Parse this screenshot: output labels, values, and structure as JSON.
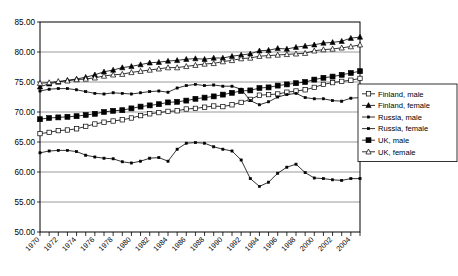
{
  "chart_data": {
    "type": "line",
    "title": "",
    "subtitle": "",
    "xlabel": "",
    "ylabel": "",
    "xlim": [
      1970,
      2005
    ],
    "ylim": [
      50.0,
      85.0
    ],
    "yticks": [
      "50.00",
      "55.00",
      "60.00",
      "65.00",
      "70.00",
      "75.00",
      "80.00",
      "85.00"
    ],
    "ytick_values": [
      50,
      55,
      60,
      65,
      70,
      75,
      80,
      85
    ],
    "xticks": [
      "1970",
      "1972",
      "1974",
      "1976",
      "1978",
      "1980",
      "1982",
      "1984",
      "1986",
      "1988",
      "1990",
      "1992",
      "1994",
      "1996",
      "1998",
      "2000",
      "2002",
      "2004"
    ],
    "xtick_values": [
      1970,
      1972,
      1974,
      1976,
      1978,
      1980,
      1982,
      1984,
      1986,
      1988,
      1990,
      1992,
      1994,
      1996,
      1998,
      2000,
      2002,
      2004
    ],
    "x": [
      1970,
      1971,
      1972,
      1973,
      1974,
      1975,
      1976,
      1977,
      1978,
      1979,
      1980,
      1981,
      1982,
      1983,
      1984,
      1985,
      1986,
      1987,
      1988,
      1989,
      1990,
      1991,
      1992,
      1993,
      1994,
      1995,
      1996,
      1997,
      1998,
      1999,
      2000,
      2001,
      2002,
      2003,
      2004,
      2005
    ],
    "grid": true,
    "grid_axis": "y",
    "legend_position": "right-middle",
    "series": [
      {
        "name": "Finland, male",
        "marker": "open-square",
        "color": "#000000",
        "values": [
          66.4,
          66.6,
          66.9,
          67.0,
          67.2,
          67.6,
          68.0,
          68.3,
          68.5,
          68.7,
          69.0,
          69.4,
          69.7,
          69.9,
          70.1,
          70.2,
          70.5,
          70.6,
          70.8,
          71.0,
          70.9,
          71.2,
          71.6,
          72.1,
          72.8,
          72.9,
          73.0,
          73.3,
          73.5,
          73.7,
          74.1,
          74.6,
          74.9,
          75.1,
          75.3,
          75.6
        ]
      },
      {
        "name": "Finland, female",
        "marker": "filled-triangle",
        "color": "#000000",
        "values": [
          74.2,
          74.7,
          75.0,
          75.3,
          75.5,
          75.8,
          76.2,
          76.7,
          77.0,
          77.4,
          77.6,
          77.9,
          78.2,
          78.3,
          78.5,
          78.6,
          78.8,
          78.9,
          78.8,
          79.0,
          79.0,
          79.3,
          79.5,
          79.7,
          80.2,
          80.3,
          80.6,
          80.5,
          80.8,
          81.0,
          81.2,
          81.5,
          81.6,
          81.8,
          82.3,
          82.5
        ]
      },
      {
        "name": "Russia, male",
        "marker": "small-dot",
        "color": "#000000",
        "values": [
          63.2,
          63.5,
          63.6,
          63.6,
          63.4,
          62.8,
          62.5,
          62.3,
          62.2,
          61.7,
          61.5,
          61.8,
          62.3,
          62.4,
          61.8,
          63.8,
          64.8,
          64.9,
          64.8,
          64.2,
          63.8,
          63.5,
          62.0,
          58.9,
          57.6,
          58.3,
          59.8,
          60.8,
          61.3,
          59.9,
          59.0,
          58.9,
          58.7,
          58.6,
          58.9,
          58.9
        ]
      },
      {
        "name": "Russia, female",
        "marker": "small-dot",
        "color": "#000000",
        "values": [
          73.5,
          73.8,
          73.9,
          73.9,
          73.7,
          73.4,
          73.1,
          73.0,
          73.2,
          73.1,
          73.0,
          73.2,
          73.4,
          73.5,
          73.3,
          74.0,
          74.4,
          74.6,
          74.4,
          74.5,
          74.3,
          74.3,
          73.8,
          71.9,
          71.2,
          71.7,
          72.5,
          72.9,
          73.1,
          72.4,
          72.2,
          72.2,
          71.9,
          71.8,
          72.3,
          72.4
        ]
      },
      {
        "name": "UK, male",
        "marker": "filled-square",
        "color": "#000000",
        "values": [
          68.8,
          69.0,
          69.1,
          69.2,
          69.3,
          69.5,
          69.7,
          70.0,
          70.2,
          70.3,
          70.6,
          70.9,
          71.1,
          71.3,
          71.6,
          71.7,
          71.9,
          72.2,
          72.4,
          72.6,
          72.9,
          73.2,
          73.5,
          73.6,
          74.0,
          74.1,
          74.4,
          74.6,
          74.8,
          75.0,
          75.4,
          75.7,
          75.9,
          76.2,
          76.5,
          76.8
        ]
      },
      {
        "name": "UK, female",
        "marker": "open-triangle",
        "color": "#000000",
        "values": [
          74.8,
          74.9,
          75.1,
          75.2,
          75.4,
          75.5,
          75.7,
          76.0,
          76.2,
          76.3,
          76.6,
          76.8,
          77.0,
          77.2,
          77.4,
          77.4,
          77.6,
          77.8,
          78.0,
          78.1,
          78.4,
          78.6,
          78.9,
          79.0,
          79.3,
          79.4,
          79.5,
          79.6,
          79.7,
          79.8,
          80.2,
          80.4,
          80.5,
          80.7,
          80.9,
          81.2
        ]
      }
    ]
  }
}
